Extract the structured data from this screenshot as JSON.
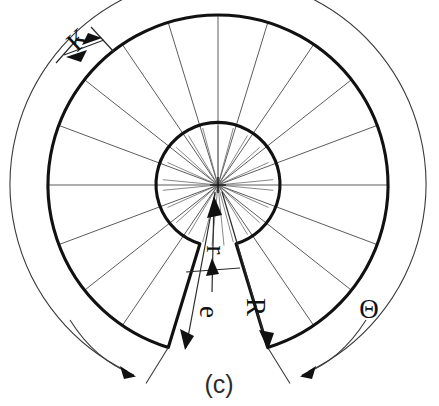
{
  "figure": {
    "caption": "(c)",
    "background_color": "#ffffff",
    "ink_color": "#111111",
    "thin_line_color": "#4a4a4a"
  },
  "geometry": {
    "center_x": 218,
    "center_y": 185,
    "inner_radius": 62,
    "outer_radius": 170,
    "theta_arc_radius": 208,
    "gap_half_angle_deg": 17,
    "radial_sector_count": 20,
    "hub_spoke_count": 24
  },
  "labels": {
    "thickness": "K",
    "inner_radius": "r",
    "gap_angle": "e",
    "outer_radius": "R",
    "total_angle": "Θ"
  },
  "label_positions": {
    "thickness": {
      "x": 84,
      "y": 46,
      "rotation": -43
    },
    "inner_radius": {
      "x": 207,
      "y": 250,
      "rotation": 90
    },
    "gap_angle": {
      "x": 200,
      "y": 312,
      "rotation": 90
    },
    "outer_radius": {
      "x": 247,
      "y": 307,
      "rotation": 90
    },
    "total_angle": {
      "x": 369,
      "y": 318,
      "rotation": 0
    }
  },
  "caption_position": {
    "x": 219,
    "y": 393
  }
}
